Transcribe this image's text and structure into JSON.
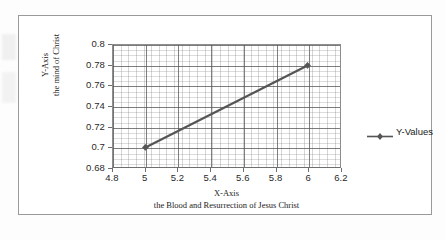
{
  "chart_data": {
    "type": "line",
    "title": "",
    "subtitle": "",
    "xlabel": "X-Axis",
    "xlabel_line2": "the Blood and Resurrection of Jesus Christ",
    "ylabel": "Y-Axis",
    "ylabel_line2": "the mind of Christ",
    "x": [
      5,
      6
    ],
    "values": [
      0.7,
      0.78
    ],
    "series": [
      {
        "name": "Y-Values",
        "x": [
          5,
          6
        ],
        "values": [
          0.7,
          0.78
        ],
        "marker": "diamond",
        "color": "#555555"
      }
    ],
    "xlim": [
      4.8,
      6.2
    ],
    "ylim": [
      0.68,
      0.8
    ],
    "x_ticks": [
      "4.8",
      "5",
      "5.2",
      "5.4",
      "5.6",
      "5.8",
      "6",
      "6.2"
    ],
    "x_tick_values": [
      4.8,
      5.0,
      5.2,
      5.4,
      5.6,
      5.8,
      6.0,
      6.2
    ],
    "y_ticks": [
      "0.68",
      "0.7",
      "0.72",
      "0.74",
      "0.76",
      "0.78",
      "0.8"
    ],
    "y_tick_values": [
      0.68,
      0.7,
      0.72,
      0.74,
      0.76,
      0.78,
      0.8
    ],
    "grid": true,
    "minor_grid": true,
    "legend": [
      "Y-Values"
    ],
    "legend_position": "right",
    "annotations": []
  },
  "legend": {
    "label": "Y-Values"
  },
  "colors": {
    "series": "#555555",
    "grid_major": "#555555",
    "grid_minor": "#787878",
    "axis": "#6f6f6f",
    "frame": "#9a9a9a",
    "text": "#222222",
    "background": "#ffffff"
  }
}
